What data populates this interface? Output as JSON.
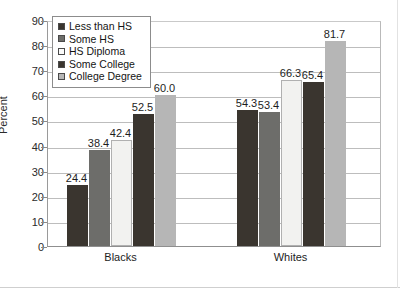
{
  "chart_data": {
    "type": "bar",
    "title": "",
    "xlabel": "",
    "ylabel": "Percent",
    "ylim": [
      0,
      90
    ],
    "ytick_step": 10,
    "yticks": [
      90,
      80,
      70,
      60,
      50,
      40,
      30,
      20,
      10,
      0
    ],
    "grid": true,
    "legend_position": "upper-left-inside",
    "categories": [
      "Blacks",
      "Whites"
    ],
    "series": [
      {
        "name": "Less than HS",
        "values": [
          24.4,
          54.3
        ],
        "color": "#3a352f"
      },
      {
        "name": "Some HS",
        "values": [
          38.4,
          53.4
        ],
        "color": "#6d6d6a"
      },
      {
        "name": "HS Diploma",
        "values": [
          42.4,
          66.3
        ],
        "color": "#f2f2f0"
      },
      {
        "name": "Some College",
        "values": [
          52.5,
          65.4
        ],
        "color": "#3a352f"
      },
      {
        "name": "College Degree",
        "values": [
          60.0,
          81.7
        ],
        "color": "#b6b6b6"
      }
    ],
    "data_labels": {
      "Blacks": [
        "24.4",
        "38.4",
        "42.4",
        "52.5",
        "60.0"
      ],
      "Whites": [
        "54.3",
        "53.4",
        "66.3",
        "65.4",
        "81.7"
      ]
    }
  },
  "legend": {
    "items": [
      {
        "label": "Less than HS",
        "swatch": "#3a352f"
      },
      {
        "label": "Some HS",
        "swatch": "#6d6d6a"
      },
      {
        "label": "HS Diploma",
        "swatch": "#fbfbfa"
      },
      {
        "label": "Some College",
        "swatch": "#3a352f"
      },
      {
        "label": "College Degree",
        "swatch": "#b6b6b6"
      }
    ]
  },
  "axis": {
    "y_title": "Percent",
    "y_labels": [
      "90",
      "80",
      "70",
      "60",
      "50",
      "40",
      "30",
      "20",
      "10",
      "0"
    ],
    "x_labels": [
      "Blacks",
      "Whites"
    ]
  }
}
